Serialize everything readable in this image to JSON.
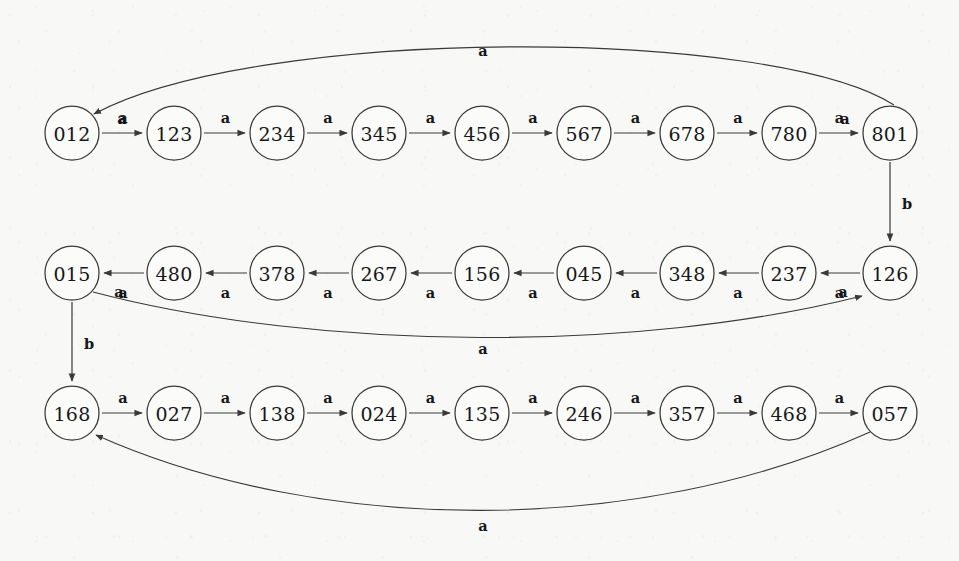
{
  "diagram": {
    "kind": "state-transition-graph",
    "alphabet": [
      "a",
      "b"
    ],
    "colors": {
      "background": "#f8f8f6",
      "node_fill": "#fbfbf9",
      "stroke": "#3a3a3a",
      "text": "#17171a"
    },
    "geometry": {
      "width": 959,
      "height": 561,
      "node_radius": 27,
      "column_x": [
        72,
        174,
        277,
        379,
        482,
        584,
        687,
        789,
        890
      ],
      "row_y": [
        133,
        273,
        413
      ]
    },
    "rows": [
      {
        "name": "row-top",
        "y": 133,
        "direction": "left-to-right",
        "nodes": [
          "012",
          "123",
          "234",
          "345",
          "456",
          "567",
          "678",
          "780",
          "801"
        ]
      },
      {
        "name": "row-middle",
        "y": 273,
        "direction": "right-to-left",
        "nodes": [
          "015",
          "480",
          "378",
          "267",
          "156",
          "045",
          "348",
          "237",
          "126"
        ]
      },
      {
        "name": "row-bottom",
        "y": 413,
        "direction": "left-to-right",
        "nodes": [
          "168",
          "027",
          "138",
          "024",
          "135",
          "246",
          "357",
          "468",
          "057"
        ]
      }
    ],
    "chain_edge_label": "a",
    "special_edges": [
      {
        "id": "wrap-top",
        "from": "801",
        "to": "012",
        "label": "a",
        "shape": "arc-above",
        "label_position": "below-apex"
      },
      {
        "id": "drop-right",
        "from": "801",
        "to": "126",
        "label": "b",
        "shape": "vertical-down",
        "label_position": "right-of-line"
      },
      {
        "id": "wrap-middle",
        "from": "015",
        "to": "126",
        "label": "a",
        "shape": "arc-below",
        "label_position": "above-apex"
      },
      {
        "id": "drop-left",
        "from": "015",
        "to": "168",
        "label": "b",
        "shape": "vertical-down",
        "label_position": "right-of-line"
      },
      {
        "id": "wrap-bottom",
        "from": "057",
        "to": "168",
        "label": "a",
        "shape": "arc-below",
        "label_position": "below-apex"
      }
    ],
    "endpoint_labels": [
      {
        "id": "wrap-top-end",
        "text": "a",
        "x": 122,
        "y": 118
      },
      {
        "id": "wrap-top-start",
        "text": "a",
        "x": 845,
        "y": 118
      },
      {
        "id": "wrap-middle-start",
        "text": "a",
        "x": 119,
        "y": 291
      },
      {
        "id": "wrap-middle-end",
        "text": "a",
        "x": 843,
        "y": 291
      }
    ]
  }
}
